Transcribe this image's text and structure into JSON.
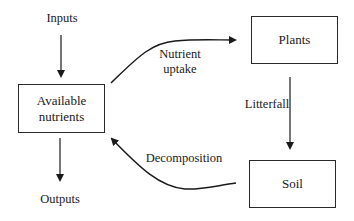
{
  "diagram": {
    "type": "nutrient-cycle",
    "nodes": [
      {
        "id": "available",
        "label_line1": "Available",
        "label_line2": "nutrients"
      },
      {
        "id": "plants",
        "label": "Plants"
      },
      {
        "id": "soil",
        "label": "Soil"
      }
    ],
    "terminals": {
      "inputs": "Inputs",
      "outputs": "Outputs"
    },
    "edges": [
      {
        "from": "inputs",
        "to": "available",
        "label": ""
      },
      {
        "from": "available",
        "to": "outputs",
        "label": ""
      },
      {
        "from": "available",
        "to": "plants",
        "label_line1": "Nutrient",
        "label_line2": "uptake"
      },
      {
        "from": "plants",
        "to": "soil",
        "label": "Litterfall"
      },
      {
        "from": "soil",
        "to": "available",
        "label": "Decomposition"
      }
    ],
    "colors": {
      "stroke": "#1a1a1a",
      "background": "#ffffff"
    }
  }
}
